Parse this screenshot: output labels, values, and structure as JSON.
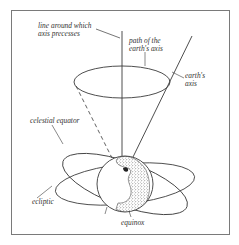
{
  "diagram": {
    "type": "astronomy-illustration",
    "labels": {
      "precession_line": [
        "line around which",
        "axis precesses"
      ],
      "axis_path": [
        "path of the",
        "earth's axis"
      ],
      "earth_axis": [
        "earth's",
        "axis"
      ],
      "celestial_equator": "celestial equator",
      "ecliptic": "ecliptic",
      "equinox": "equinox"
    },
    "colors": {
      "line": "#3a3a3a",
      "frame": "#7a7a7a",
      "background": "#ffffff"
    }
  }
}
